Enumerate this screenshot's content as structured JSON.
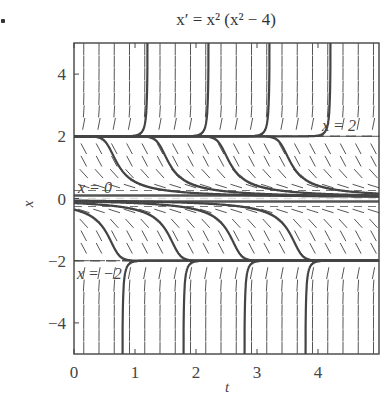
{
  "chart_data": {
    "type": "line",
    "subtype": "direction_field",
    "title": "x′ = x² (x² − 4)",
    "xlabel": "t",
    "ylabel": "x",
    "xlim": [
      0,
      5
    ],
    "ylim": [
      -5,
      5
    ],
    "xticks": [
      0,
      1,
      2,
      3,
      4
    ],
    "yticks": [
      -4,
      -2,
      0,
      2,
      4
    ],
    "grid": false,
    "equilibria": [
      {
        "value": 2,
        "label": "x = 2",
        "style": "dashed"
      },
      {
        "value": 0,
        "label": "x = 0",
        "style": "dashed"
      },
      {
        "value": -2,
        "label": "x = −2",
        "style": "dashed"
      }
    ],
    "trajectories_note": "solution curves of x' = x^2 (x^2 - 4); curves above x=2 blow up near t=1,2,3,4; curves between 0 and 2 decay toward 0; curves between -2 and 0 decay toward -2; curves below -2 rise toward -2",
    "trajectory_seeds": [
      {
        "t0": 1.0,
        "x0": 2.02,
        "dir": "up"
      },
      {
        "t0": 2.0,
        "x0": 2.02,
        "dir": "up"
      },
      {
        "t0": 3.0,
        "x0": 2.02,
        "dir": "up"
      },
      {
        "t0": 4.0,
        "x0": 2.02,
        "dir": "up"
      },
      {
        "t0": 0.75,
        "x0": 1.0
      },
      {
        "t0": 1.6,
        "x0": 1.0
      },
      {
        "t0": 2.6,
        "x0": 1.0
      },
      {
        "t0": 3.6,
        "x0": 1.0
      },
      {
        "t0": 0.5,
        "x0": -1.0
      },
      {
        "t0": 1.5,
        "x0": -1.0
      },
      {
        "t0": 2.5,
        "x0": -1.0
      },
      {
        "t0": 3.5,
        "x0": -1.0
      },
      {
        "t0": 1.0,
        "x0": -2.02,
        "dir": "down"
      },
      {
        "t0": 2.0,
        "x0": -2.02,
        "dir": "down"
      },
      {
        "t0": 3.0,
        "x0": -2.02,
        "dir": "down"
      },
      {
        "t0": 4.0,
        "x0": -2.02,
        "dir": "down"
      }
    ]
  }
}
